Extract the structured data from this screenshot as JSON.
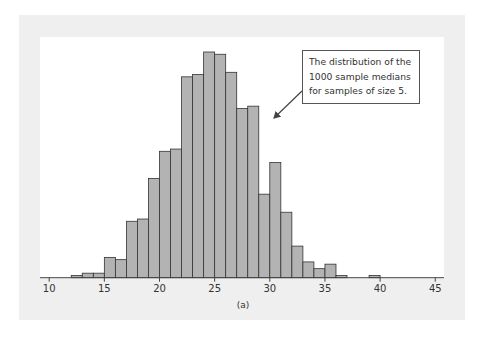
{
  "chart_data": {
    "type": "bar",
    "title": "",
    "xlabel": "",
    "ylabel": "",
    "caption": "(a)",
    "annotation": [
      "The distribution of the",
      "1000 sample medians",
      "for samples of size 5."
    ],
    "bin_width": 1,
    "bins_left_edge": [
      12,
      13,
      14,
      15,
      16,
      17,
      18,
      19,
      20,
      21,
      22,
      23,
      24,
      25,
      26,
      27,
      28,
      29,
      30,
      31,
      32,
      33,
      34,
      35,
      36,
      39
    ],
    "values": [
      1,
      2,
      2,
      9,
      8,
      25,
      26,
      44,
      56,
      57,
      89,
      90,
      100,
      99,
      91,
      75,
      76,
      37,
      51,
      29,
      14,
      7,
      4,
      6,
      1,
      1
    ],
    "xlim": [
      10,
      45
    ],
    "xticks": [
      10,
      15,
      20,
      25,
      30,
      35,
      40,
      45
    ],
    "ylim": [
      0,
      100
    ],
    "grid": false,
    "legend": "none",
    "colors": {
      "bar_fill": "#b3b3b3",
      "bar_edge": "#333333",
      "panel_bg": "#efefef",
      "plot_bg": "#ffffff"
    }
  }
}
